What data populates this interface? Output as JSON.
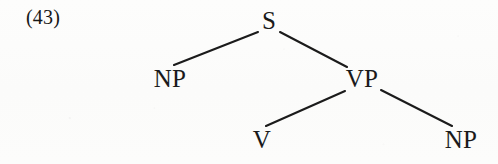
{
  "figure": {
    "example_number": "(43)",
    "kind": "syntax-tree",
    "page_background": "#fcfcfb",
    "ink_color": "#1a1a1a"
  },
  "tree": {
    "root_label": "S",
    "nodes": [
      {
        "id": "S",
        "label": "S",
        "x": 269,
        "y": 27,
        "level": 0
      },
      {
        "id": "NP1",
        "label": "NP",
        "x": 170,
        "y": 86,
        "level": 1
      },
      {
        "id": "VP",
        "label": "VP",
        "x": 362,
        "y": 86,
        "level": 1
      },
      {
        "id": "V",
        "label": "V",
        "x": 262,
        "y": 147,
        "level": 2
      },
      {
        "id": "NP2",
        "label": "NP",
        "x": 461,
        "y": 147,
        "level": 2
      }
    ],
    "edges": [
      {
        "from": "S",
        "to": "NP1",
        "x1": 258,
        "y1": 32,
        "x2": 174,
        "y2": 65
      },
      {
        "from": "S",
        "to": "VP",
        "x1": 280,
        "y1": 32,
        "x2": 347,
        "y2": 67
      },
      {
        "from": "VP",
        "to": "V",
        "x1": 345,
        "y1": 91,
        "x2": 266,
        "y2": 126
      },
      {
        "from": "VP",
        "to": "NP2",
        "x1": 381,
        "y1": 90,
        "x2": 452,
        "y2": 126
      }
    ],
    "rules": [
      "S → NP VP",
      "VP → V NP"
    ]
  }
}
